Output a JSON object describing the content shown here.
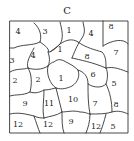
{
  "figure": {
    "title": "C",
    "colors": {
      "stroke": "#333333",
      "text": "#222222",
      "background": "#ffffff"
    },
    "regions": [
      {
        "label": "4",
        "x": 18,
        "y": 32
      },
      {
        "label": "3",
        "x": 45,
        "y": 32
      },
      {
        "label": "1",
        "x": 69,
        "y": 31
      },
      {
        "label": "4",
        "x": 91,
        "y": 34
      },
      {
        "label": "8",
        "x": 111,
        "y": 27
      },
      {
        "label": "3",
        "x": 12,
        "y": 61
      },
      {
        "label": "4",
        "x": 33,
        "y": 56
      },
      {
        "label": "1",
        "x": 60,
        "y": 50
      },
      {
        "label": "8",
        "x": 87,
        "y": 57
      },
      {
        "label": "7",
        "x": 116,
        "y": 53
      },
      {
        "label": "2",
        "x": 15,
        "y": 81
      },
      {
        "label": "2",
        "x": 38,
        "y": 80
      },
      {
        "label": "1",
        "x": 61,
        "y": 79
      },
      {
        "label": "6",
        "x": 93,
        "y": 75
      },
      {
        "label": "5",
        "x": 114,
        "y": 84
      },
      {
        "label": "9",
        "x": 25,
        "y": 104
      },
      {
        "label": "11",
        "x": 49,
        "y": 104
      },
      {
        "label": "10",
        "x": 73,
        "y": 100
      },
      {
        "label": "7",
        "x": 95,
        "y": 104
      },
      {
        "label": "8",
        "x": 116,
        "y": 105
      },
      {
        "label": "12",
        "x": 18,
        "y": 125
      },
      {
        "label": "12",
        "x": 48,
        "y": 125
      },
      {
        "label": "9",
        "x": 71,
        "y": 122
      },
      {
        "label": "12",
        "x": 96,
        "y": 127
      },
      {
        "label": "5",
        "x": 113,
        "y": 127
      }
    ]
  }
}
